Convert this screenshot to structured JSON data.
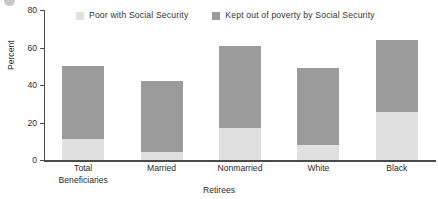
{
  "chart_data": {
    "type": "bar",
    "subtype": "stacked-vertical",
    "title": "",
    "xlabel": "Retirees",
    "ylabel": "Percent",
    "ylim": [
      0,
      80
    ],
    "yticks": [
      0,
      20,
      40,
      60,
      80
    ],
    "grid": false,
    "legend_position": "top",
    "categories": [
      "Total Beneficiaries",
      "Married",
      "Nonmarried",
      "White",
      "Black"
    ],
    "category_lines": [
      [
        "Total",
        "Beneficiaries"
      ],
      [
        "Married",
        ""
      ],
      [
        "Nonmarried",
        ""
      ],
      [
        "White",
        ""
      ],
      [
        "Black",
        ""
      ]
    ],
    "series": [
      {
        "name": "Poor with Social Security",
        "color": "#e0e0e0",
        "values": [
          11,
          4.5,
          17,
          8,
          25.5
        ]
      },
      {
        "name": "Kept out of poverty by Social Security",
        "color": "#9b9b9b",
        "values": [
          39,
          37.5,
          44,
          41,
          38.5
        ]
      }
    ],
    "totals": [
      50,
      42,
      61,
      49,
      64
    ]
  },
  "legend": {
    "entries": [
      {
        "label": "Poor with Social Security",
        "color": "#e0e0e0"
      },
      {
        "label": "Kept out of poverty by Social Security",
        "color": "#9b9b9b"
      }
    ]
  },
  "axes": {
    "y_title": "Percent",
    "x_title": "Retirees",
    "y_tick_labels": [
      "0",
      "20",
      "40",
      "60",
      "80"
    ]
  },
  "colors": {
    "bar_light": "#e0e0e0",
    "bar_dark": "#9b9b9b",
    "axis": "#4a4a4a",
    "text": "#2b2b2b",
    "background": "#ffffff"
  }
}
